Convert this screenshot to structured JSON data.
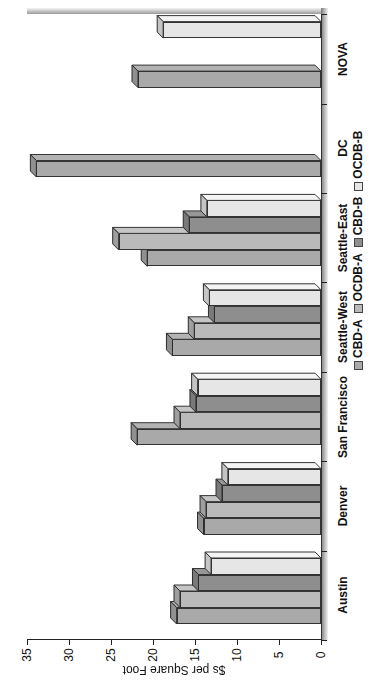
{
  "chart_data": {
    "type": "bar",
    "orientation": "rotated-3d-column",
    "title": "",
    "xlabel": "",
    "ylabel": "$s per Square Foot",
    "ylim": [
      0,
      35
    ],
    "yticks": [
      "0",
      "5",
      "10",
      "15",
      "20",
      "25",
      "30",
      "35"
    ],
    "grid": false,
    "legend_position": "bottom",
    "categories": [
      "Austin",
      "Denver",
      "San Francisco",
      "Seattle-West",
      "Seattle-East",
      "DC",
      "NOVA"
    ],
    "series": [
      {
        "name": "CBD-A",
        "color": "#a9a9a9",
        "values": [
          17.9,
          14.7,
          22.6,
          18.4,
          21.4,
          34.6,
          22.5
        ]
      },
      {
        "name": "OCDB-A",
        "color": "#bababa",
        "values": [
          17.5,
          14.4,
          17.5,
          15.8,
          24.8,
          null,
          null
        ]
      },
      {
        "name": "CBD-B",
        "color": "#8e8e8e",
        "values": [
          15.3,
          12.5,
          15.6,
          13.4,
          16.4,
          null,
          null
        ]
      },
      {
        "name": "OCDB-B",
        "color": "#e6e6e6",
        "values": [
          13.8,
          11.8,
          15.4,
          14.0,
          14.3,
          null,
          19.5
        ]
      }
    ]
  }
}
